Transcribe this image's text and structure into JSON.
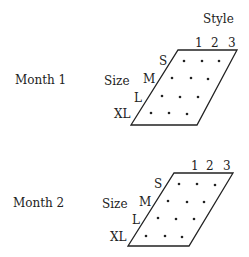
{
  "axes": {
    "style_title": "Style",
    "size_title": "Size",
    "styles": [
      "1",
      "2",
      "3"
    ],
    "sizes": [
      "S",
      "M",
      "L",
      "XL"
    ]
  },
  "panels": [
    {
      "label": "Month 1"
    },
    {
      "label": "Month 2"
    }
  ],
  "colors": {
    "ink": "#222222",
    "background": "#ffffff"
  }
}
